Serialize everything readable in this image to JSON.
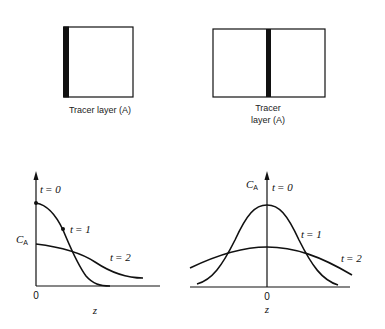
{
  "panels": {
    "left_box": {
      "label": "Tracer layer (A)",
      "tracer_position": "left-edge"
    },
    "right_box": {
      "label_line1": "Tracer",
      "label_line2": "layer (A)",
      "tracer_position": "center"
    }
  },
  "left_plot": {
    "y_label": "C",
    "y_label_sub": "A",
    "x_label": "z",
    "origin_label": "0",
    "curves": [
      {
        "name": "t = 0",
        "t": "t",
        "eq": "= 0"
      },
      {
        "name": "t = 1",
        "t": "t",
        "eq": "= 1"
      },
      {
        "name": "t = 2",
        "t": "t",
        "eq": "= 2"
      }
    ]
  },
  "right_plot": {
    "y_label": "C",
    "y_label_sub": "A",
    "x_label": "z",
    "origin_label": "0",
    "curves": [
      {
        "name": "t = 0",
        "t": "t",
        "eq": "= 0"
      },
      {
        "name": "t = 1",
        "t": "t",
        "eq": "= 1"
      },
      {
        "name": "t = 2",
        "t": "t",
        "eq": "= 2"
      }
    ]
  },
  "colors": {
    "line": "#111111",
    "background": "#ffffff"
  }
}
